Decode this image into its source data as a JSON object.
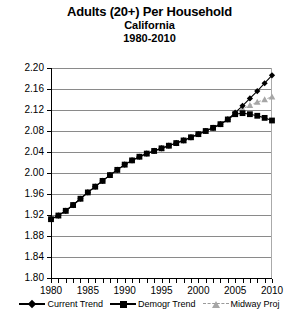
{
  "titles": {
    "main": "Adults (20+) Per Household",
    "sub": "California",
    "sub2": "1980-2010"
  },
  "legend": {
    "items": [
      {
        "label": "Current Trend",
        "marker": "diamond-marker",
        "color": "#000000"
      },
      {
        "label": "Demogr Trend",
        "marker": "square-marker",
        "color": "#000000"
      },
      {
        "label": "Midway Proj",
        "marker": "triangle-marker",
        "color": "#a6a6a6"
      }
    ]
  },
  "chart_data": {
    "type": "line",
    "title": "Adults (20+) Per Household",
    "subtitle": "California",
    "subtitle2": "1980-2010",
    "xlabel": "",
    "ylabel": "",
    "xlim": [
      1980,
      2010
    ],
    "ylim": [
      1.8,
      2.2
    ],
    "yticks": [
      "2.20",
      "2.16",
      "2.12",
      "2.08",
      "2.04",
      "2.00",
      "1.96",
      "1.92",
      "1.88",
      "1.84",
      "1.80"
    ],
    "ytick_values": [
      2.2,
      2.16,
      2.12,
      2.08,
      2.04,
      2.0,
      1.96,
      1.92,
      1.88,
      1.84,
      1.8
    ],
    "xticks": [
      "1980",
      "1985",
      "1990",
      "1995",
      "2000",
      "2005",
      "2010"
    ],
    "xtick_values": [
      1980,
      1985,
      1990,
      1995,
      2000,
      2005,
      2010
    ],
    "xtick_minor_values": [
      1981,
      1982,
      1983,
      1984,
      1986,
      1987,
      1988,
      1989,
      1991,
      1992,
      1993,
      1994,
      1996,
      1997,
      1998,
      1999,
      2001,
      2002,
      2003,
      2004,
      2006,
      2007,
      2008,
      2009
    ],
    "grid": true,
    "legend_position": "bottom",
    "x": [
      1980,
      1981,
      1982,
      1983,
      1984,
      1985,
      1986,
      1987,
      1988,
      1989,
      1990,
      1991,
      1992,
      1993,
      1994,
      1995,
      1996,
      1997,
      1998,
      1999,
      2000,
      2001,
      2002,
      2003,
      2004,
      2005,
      2006,
      2007,
      2008,
      2009,
      2010
    ],
    "series": [
      {
        "name": "Current Trend",
        "marker": "diamond",
        "color": "#000000",
        "values": [
          1.912,
          1.919,
          1.928,
          1.939,
          1.951,
          1.963,
          1.974,
          1.985,
          1.996,
          2.006,
          2.016,
          2.024,
          2.031,
          2.037,
          2.042,
          2.047,
          2.052,
          2.057,
          2.062,
          2.068,
          2.074,
          2.08,
          2.086,
          2.093,
          2.102,
          2.115,
          2.128,
          2.142,
          2.156,
          2.171,
          2.186
        ]
      },
      {
        "name": "Demogr Trend",
        "marker": "square",
        "color": "#000000",
        "values": [
          1.912,
          1.919,
          1.928,
          1.939,
          1.951,
          1.963,
          1.974,
          1.985,
          1.996,
          2.006,
          2.016,
          2.024,
          2.031,
          2.037,
          2.042,
          2.047,
          2.052,
          2.057,
          2.062,
          2.068,
          2.074,
          2.08,
          2.086,
          2.093,
          2.102,
          2.112,
          2.114,
          2.112,
          2.109,
          2.105,
          2.1
        ]
      },
      {
        "name": "Midway Proj",
        "marker": "triangle",
        "color": "#a6a6a6",
        "values": [
          1.912,
          1.919,
          1.928,
          1.939,
          1.951,
          1.963,
          1.974,
          1.985,
          1.996,
          2.006,
          2.016,
          2.024,
          2.031,
          2.037,
          2.042,
          2.047,
          2.052,
          2.057,
          2.062,
          2.068,
          2.074,
          2.08,
          2.086,
          2.093,
          2.102,
          2.114,
          2.122,
          2.129,
          2.135,
          2.14,
          2.145
        ]
      }
    ]
  }
}
